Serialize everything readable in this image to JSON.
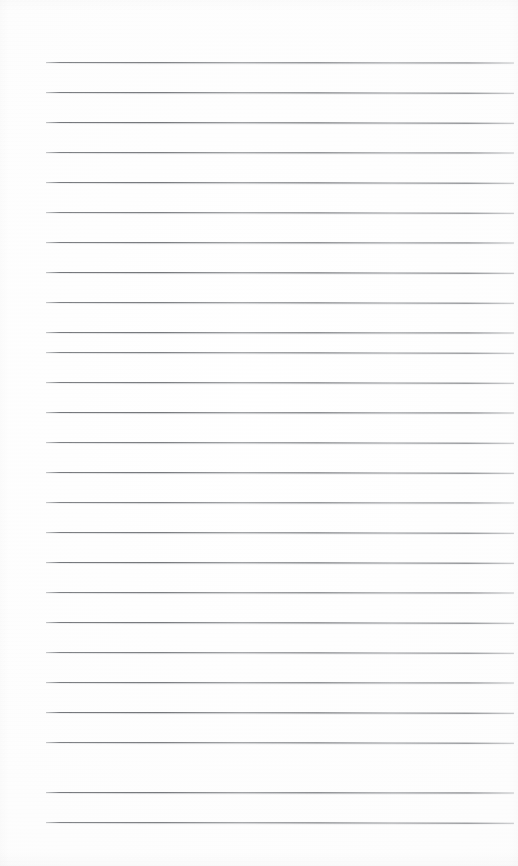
{
  "document": {
    "kind": "ruled-notepad-page",
    "description": "Blank lined writing paper, scanned",
    "width": 518,
    "height": 866,
    "page_background_color": "#fdfdfd",
    "has_text_content": false,
    "text_content": "",
    "header_text": "",
    "footer_text": "",
    "page_number": ""
  },
  "ruling": {
    "line_color": "#5c5f64",
    "line_color_faded_end": "#96989c",
    "line_thickness_px": 1,
    "line_count": 26,
    "line_spacing_px": 30,
    "first_line_y": 62,
    "last_line_y": 822,
    "left_margin_x": 46,
    "right_edge_x": 514,
    "line_length_px": 468,
    "tilt_degrees": 0.08,
    "top_blank_margin_px": 62,
    "bottom_blank_margin_px": 44,
    "line_y_positions": [
      62,
      92,
      122,
      152,
      182,
      212,
      242,
      272,
      302,
      332,
      352,
      382,
      412,
      442,
      472,
      502,
      532,
      562,
      592,
      622,
      652,
      682,
      712,
      742,
      792,
      822
    ]
  },
  "margins": {
    "has_vertical_margin_rule": false,
    "has_header_rule": false,
    "has_holes": false
  }
}
